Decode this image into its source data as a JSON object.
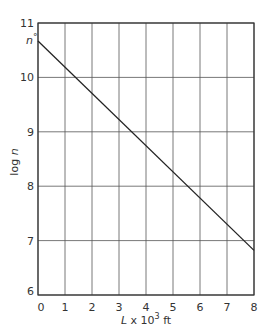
{
  "chart_data": {
    "type": "line",
    "title": "",
    "xlabel": "L x 10^3 ft",
    "ylabel": "log n",
    "xlim": [
      0,
      8
    ],
    "ylim": [
      6,
      11
    ],
    "grid": true,
    "x_ticks": [
      "0",
      "1",
      "2",
      "3",
      "4",
      "5",
      "6",
      "7",
      "8"
    ],
    "y_ticks": [
      "6",
      "7",
      "8",
      "9",
      "10",
      "11"
    ],
    "annotations": [
      {
        "text": "n°",
        "x": 0,
        "y": 10.67,
        "note": "intercept label on y-axis"
      }
    ],
    "series": [
      {
        "name": "log n",
        "x": [
          0,
          8
        ],
        "y": [
          10.67,
          6.82
        ]
      }
    ]
  },
  "labels": {
    "xlabel_main": "L",
    "xlabel_times": "x 10",
    "xlabel_exp": "3",
    "xlabel_unit": "ft",
    "ylabel_log": "log",
    "ylabel_n": "n",
    "intercept_n": "n",
    "intercept_deg": "°"
  }
}
